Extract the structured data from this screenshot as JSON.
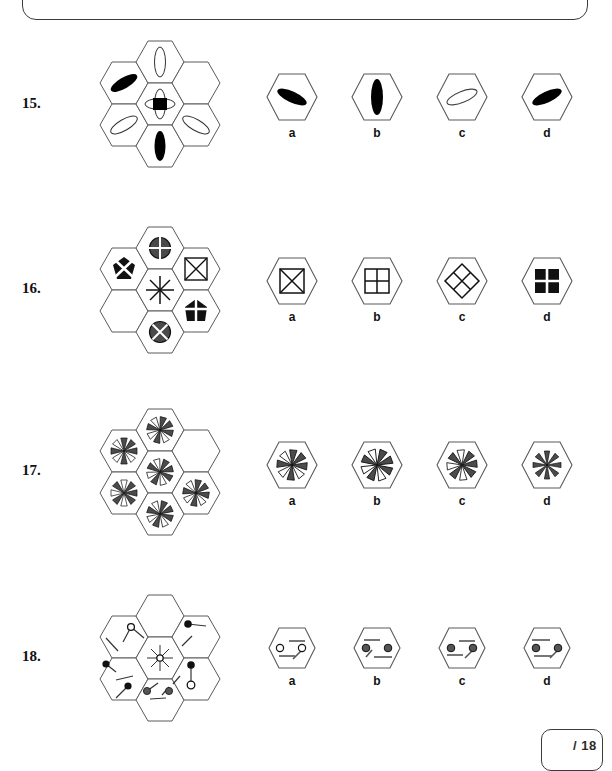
{
  "page": {
    "score_label": "/ 18",
    "total_questions": 18
  },
  "questions": [
    {
      "number": "15.",
      "top": 30,
      "cluster_top": 28,
      "matrix": {
        "description": "hexagon-flower-7-cells",
        "cells": [
          {
            "pos": "top",
            "shape": "ellipse-outline-vertical"
          },
          {
            "pos": "upper-left",
            "shape": "ellipse-filled-diagonal-up"
          },
          {
            "pos": "upper-right",
            "shape": "empty"
          },
          {
            "pos": "center",
            "shape": "square-filled-with-crossed-ellipses"
          },
          {
            "pos": "lower-left",
            "shape": "ellipse-outline-diagonal-up"
          },
          {
            "pos": "lower-right",
            "shape": "ellipse-outline-diagonal-down"
          },
          {
            "pos": "bottom",
            "shape": "ellipse-filled-vertical"
          }
        ]
      },
      "options": [
        {
          "label": "a",
          "shape": "ellipse-filled-diagonal-down"
        },
        {
          "label": "b",
          "shape": "ellipse-filled-vertical"
        },
        {
          "label": "c",
          "shape": "ellipse-outline-diagonal-up"
        },
        {
          "label": "d",
          "shape": "ellipse-filled-diagonal-up"
        }
      ]
    },
    {
      "number": "16.",
      "top": 212,
      "cluster_top": 212,
      "matrix": {
        "description": "hexagon-flower-7-cells",
        "cells": [
          {
            "pos": "top",
            "shape": "circle-dark-white-cross"
          },
          {
            "pos": "upper-left",
            "shape": "pentagon-black-white-x"
          },
          {
            "pos": "upper-right",
            "shape": "square-outline-with-x"
          },
          {
            "pos": "center",
            "shape": "asterisk-eight-spoke"
          },
          {
            "pos": "lower-left",
            "shape": "empty"
          },
          {
            "pos": "lower-right",
            "shape": "pentagon-black-white-cross"
          },
          {
            "pos": "bottom",
            "shape": "circle-dark-white-x"
          }
        ]
      },
      "options": [
        {
          "label": "a",
          "shape": "square-outline-with-x"
        },
        {
          "label": "b",
          "shape": "square-outline-quartered"
        },
        {
          "label": "c",
          "shape": "diamond-outline-quartered"
        },
        {
          "label": "d",
          "shape": "square-black-white-cross"
        }
      ]
    },
    {
      "number": "17.",
      "top": 392,
      "cluster_top": 392,
      "matrix": {
        "description": "hexagon-flower-7-cells",
        "cells": [
          {
            "pos": "top",
            "shape": "pinwheel-8-blade-rot-15"
          },
          {
            "pos": "upper-left",
            "shape": "pinwheel-8-blade-rot-0"
          },
          {
            "pos": "upper-right",
            "shape": "empty"
          },
          {
            "pos": "center",
            "shape": "pinwheel-8-blade-rot-30"
          },
          {
            "pos": "lower-left",
            "shape": "pinwheel-8-blade-rot-45"
          },
          {
            "pos": "lower-right",
            "shape": "pinwheel-8-blade-rot-10"
          },
          {
            "pos": "bottom",
            "shape": "pinwheel-8-blade-rot-20"
          }
        ]
      },
      "options": [
        {
          "label": "a",
          "shape": "pinwheel-8-blade-rot-5"
        },
        {
          "label": "b",
          "shape": "pinwheel-8-blade-rot-25"
        },
        {
          "label": "c",
          "shape": "pinwheel-8-blade-rot-40"
        },
        {
          "label": "d",
          "shape": "pinwheel-8-blade-rot-0"
        }
      ]
    },
    {
      "number": "18.",
      "top": 578,
      "cluster_top": 578,
      "matrix": {
        "description": "hexagon-flower-7-cells",
        "cells": [
          {
            "pos": "top",
            "shape": "empty"
          },
          {
            "pos": "upper-left",
            "shape": "lines-with-open-circle"
          },
          {
            "pos": "upper-right",
            "shape": "lines-with-black-circle"
          },
          {
            "pos": "center",
            "shape": "radial-burst-open-circle"
          },
          {
            "pos": "lower-left",
            "shape": "lines-with-black-circles"
          },
          {
            "pos": "lower-right",
            "shape": "lines-black-and-open-circle"
          },
          {
            "pos": "bottom",
            "shape": "lines-with-gray-circles"
          }
        ]
      },
      "options": [
        {
          "label": "a",
          "shape": "two-open-circles-with-lines"
        },
        {
          "label": "b",
          "shape": "two-gray-circles-with-lines"
        },
        {
          "label": "c",
          "shape": "two-gray-circles-with-lines-alt"
        },
        {
          "label": "d",
          "shape": "two-gray-circles-with-lines-alt2"
        }
      ]
    }
  ],
  "colors": {
    "ink": "#111111",
    "hex_stroke": "#5a5a5a",
    "gray_fill": "#555555",
    "panel_stroke": "#3b3b3b"
  }
}
